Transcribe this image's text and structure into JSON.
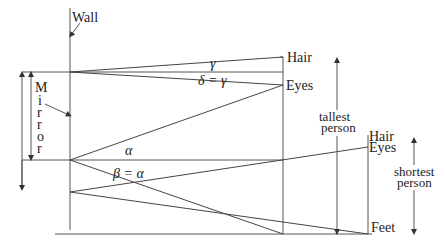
{
  "figure": {
    "labels": {
      "wall": "Wall",
      "mirror_letters": [
        "M",
        "i",
        "r",
        "r",
        "o",
        "r"
      ],
      "tall_hair": "Hair",
      "tall_eyes": "Eyes",
      "short_hair": "Hair",
      "short_eyes": "Eyes",
      "feet": "Feet",
      "tallest_line1": "tallest",
      "tallest_line2": "person",
      "shortest_line1": "shortest",
      "shortest_line2": "person"
    },
    "angles": {
      "gamma": "γ",
      "delta_eq_gamma": "δ = γ",
      "alpha": "α",
      "beta_eq_alpha": "β = α"
    }
  }
}
